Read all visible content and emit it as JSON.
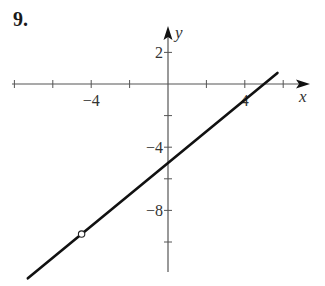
{
  "problem_number": "9.",
  "chart_data": {
    "type": "line",
    "title": "",
    "xlabel": "x",
    "ylabel": "y",
    "x_ticks": [
      -8,
      -6,
      -4,
      -2,
      2,
      4,
      6
    ],
    "x_tick_labels": [
      {
        "value": -4,
        "label": "−4"
      },
      {
        "value": 4,
        "label": "4"
      }
    ],
    "y_ticks": [
      2,
      -2,
      -4,
      -6,
      -8,
      -10
    ],
    "y_tick_labels": [
      {
        "value": 2,
        "label": "2"
      },
      {
        "value": -4,
        "label": "−4"
      },
      {
        "value": -8,
        "label": "−8"
      }
    ],
    "xlim": [
      -8,
      7
    ],
    "ylim": [
      -12,
      3
    ],
    "grid": false,
    "series": [
      {
        "name": "y = x - 5",
        "equation": "y = x - 5",
        "x": [
          -7.3,
          5.7
        ],
        "y": [
          -12.3,
          0.7
        ],
        "open_points": [
          {
            "x": -4.5,
            "y": -9.5
          }
        ]
      }
    ]
  }
}
